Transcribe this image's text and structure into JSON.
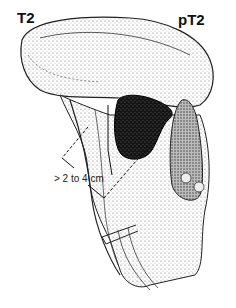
{
  "figure": {
    "type": "anatomical illustration",
    "labels": {
      "left_stage": "T2",
      "right_stage": "pT2",
      "measurement": "> 2 to 4 cm"
    },
    "colors": {
      "ink": "#111111",
      "tumor": "#1a1a1a",
      "tissue_shade": "#d9d9d9",
      "background": "#ffffff"
    }
  }
}
